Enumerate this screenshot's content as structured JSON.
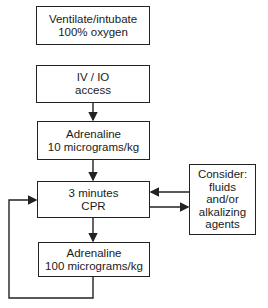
{
  "diagram": {
    "type": "flowchart",
    "nodes": [
      {
        "id": "ventilate",
        "lines": [
          "Ventilate/intubate",
          "100% oxygen"
        ]
      },
      {
        "id": "access",
        "lines": [
          "IV / IO",
          "access"
        ]
      },
      {
        "id": "adrenaline1",
        "lines": [
          "Adrenaline",
          "10 micrograms/kg"
        ]
      },
      {
        "id": "cpr",
        "lines": [
          "3 minutes",
          "CPR"
        ]
      },
      {
        "id": "adrenaline2",
        "lines": [
          "Adrenaline",
          "100 micrograms/kg"
        ]
      },
      {
        "id": "consider",
        "lines": [
          "Consider:",
          "fluids",
          "and/or",
          "alkalizing",
          "agents"
        ]
      }
    ],
    "edges": [
      {
        "from": "access",
        "to": "adrenaline1"
      },
      {
        "from": "adrenaline1",
        "to": "cpr"
      },
      {
        "from": "cpr",
        "to": "adrenaline2"
      },
      {
        "from": "cpr",
        "to": "consider"
      },
      {
        "from": "consider",
        "to": "cpr"
      },
      {
        "from": "adrenaline2",
        "to": "cpr",
        "label": "loop"
      }
    ]
  },
  "colors": {
    "stroke": "#222222",
    "background": "#ffffff"
  }
}
